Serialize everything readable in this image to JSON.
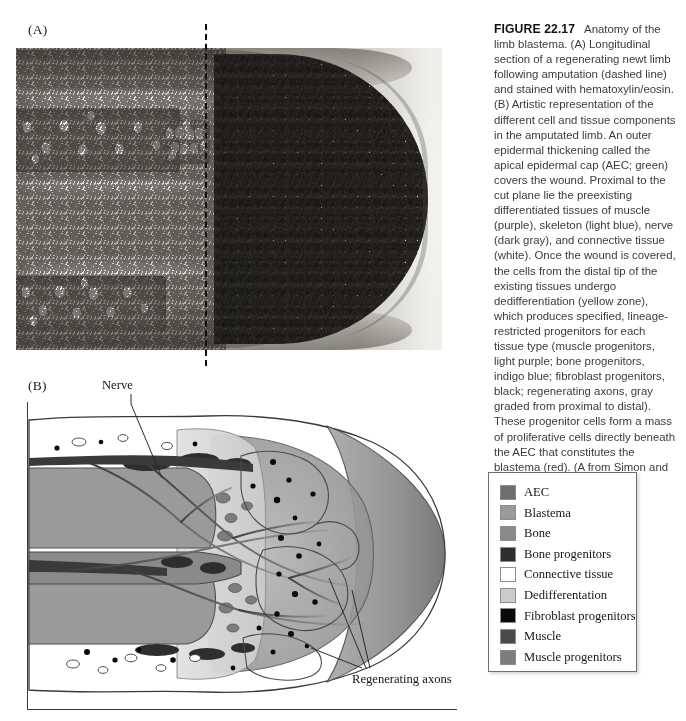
{
  "figure": {
    "number": "FIGURE 22.17",
    "title": "Anatomy of the limb blastema.",
    "caption": "(A) Longitudinal section of a regenerating newt limb following amputation (dashed line) and stained with hematoxylin/eosin. (B) Artistic representation of the different cell and tissue components in the amputated limb. An outer epidermal thickening called the apical epidermal cap (AEC; green) covers the wound. Proximal to the cut plane lie the preexisting differentiated tissues of muscle (purple), skeleton (light blue), nerve (dark gray), and connective tissue (white). Once the wound is covered, the cells from the distal tip of the existing tissues undergo dedifferentiation (yellow zone), which produces specified, lineage-restricted progenitors for each tissue type (muscle progenitors, light purple; bone progenitors, indigo blue; fibroblast progenitors, black; regenerating axons, gray graded from proximal to distal). These progenitor cells form a mass of proliferative cells directly beneath the AEC that constitutes the blastema (red). (A from Simon and Tanaka 2013.)"
  },
  "panels": {
    "a": {
      "label": "(A)",
      "description": "Hematoxylin/eosin stained longitudinal histological section of regenerating newt limb"
    },
    "b": {
      "label": "(B)",
      "description": "Artistic schematic representation of cell and tissue components in the amputated limb"
    }
  },
  "annotations": [
    {
      "id": "nerve",
      "label": "Nerve"
    },
    {
      "id": "axons",
      "label": "Regenerating axons"
    }
  ],
  "legend": {
    "items": [
      {
        "label": "AEC",
        "color": "#6e6e6e"
      },
      {
        "label": "Blastema",
        "color": "#9a9a9a"
      },
      {
        "label": "Bone",
        "color": "#8a8a8a"
      },
      {
        "label": "Bone progenitors",
        "color": "#2e2e2e"
      },
      {
        "label": "Connective tissue",
        "color": "#ffffff"
      },
      {
        "label": "Dedifferentation",
        "color": "#cbcbcb"
      },
      {
        "label": "Fibroblast progenitors",
        "color": "#0a0a0a"
      },
      {
        "label": "Muscle",
        "color": "#4a4a4a"
      },
      {
        "label": "Muscle progenitors",
        "color": "#7d7d7d"
      }
    ]
  },
  "colors": {
    "aec": "#6e6e6e",
    "blastema": "#9a9a9a",
    "bone": "#8a8a8a",
    "bone_progenitors": "#2e2e2e",
    "connective_tissue": "#ffffff",
    "dedifferentiation": "#cbcbcb",
    "fibroblast_progenitors": "#0a0a0a",
    "muscle": "#4a4a4a",
    "muscle_progenitors": "#7d7d7d",
    "outline": "#3a3a3a",
    "page_background": "#ffffff"
  }
}
